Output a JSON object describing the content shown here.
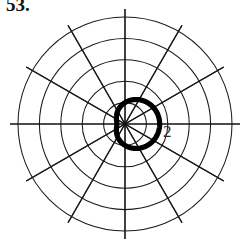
{
  "figure": {
    "exercise_number": "53.",
    "caption": "",
    "background_color": "#ffffff",
    "ink_color": "#000000"
  },
  "chart_data": {
    "type": "line",
    "plot_kind": "polar",
    "title": "53.",
    "xlabel": "",
    "ylabel": "",
    "grid": true,
    "legend_position": "none",
    "center": {
      "x": 125,
      "y": 124
    },
    "radial_axis": {
      "unit_pixels": 21.4,
      "tick_values": [
        1,
        2,
        3,
        4,
        5
      ],
      "max_radius": 5,
      "visible_tick_labels": [
        {
          "value": "2",
          "x": 168,
          "y": 130
        }
      ]
    },
    "angular_axis": {
      "spoke_count": 12,
      "spoke_step_degrees": 30,
      "spoke_angles_degrees": [
        0,
        30,
        60,
        90,
        120,
        150,
        180,
        210,
        240,
        270,
        300,
        330
      ],
      "axis_lines_degrees": [
        0,
        90,
        180,
        270
      ]
    },
    "grid_circles_radii": [
      1,
      2,
      3,
      4,
      5
    ],
    "series": [
      {
        "name": "limacon",
        "equation_form": "r = a + b*cos(theta)",
        "a": 1.0,
        "b": 0.62,
        "theta_start_degrees": 0,
        "theta_end_degrees": 360,
        "r_max": 1.62,
        "r_min": 0.38,
        "stroke_width": 5.2,
        "color": "#000000"
      }
    ],
    "annotations": [
      {
        "text": "2",
        "x": 168,
        "y": 130
      }
    ]
  },
  "labels": {
    "radial_tick_2": "2"
  }
}
